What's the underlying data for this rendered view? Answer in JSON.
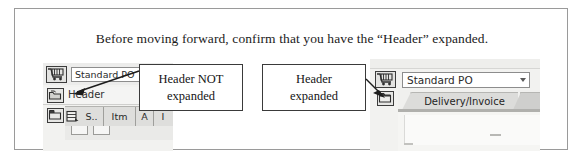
{
  "figure": {
    "caption": "Before moving forward, confirm that you have the “Header” expanded."
  },
  "callouts": [
    {
      "id": "header-not-expanded",
      "line1": "Header NOT",
      "line2": "expanded",
      "points_to": "collapsed-header-toggle"
    },
    {
      "id": "header-expanded",
      "line1": "Header",
      "line2": "expanded",
      "points_to": "expanded-header-toggle"
    }
  ],
  "left_panel": {
    "cart_icon": "shopping-cart-icon",
    "po_type_value": "Standard PO",
    "header_toggle_icon": "expand-header-icon",
    "header_label": "Header",
    "item_toggle_icon": "expand-item-icon",
    "grid_select_icon": "grid-select-all-icon",
    "grid_columns": [
      "S..",
      "Itm",
      "A",
      "I"
    ]
  },
  "right_panel": {
    "cart_icon": "shopping-cart-icon",
    "po_type_value": "Standard PO",
    "po_type_dropdown_icon": "chevron-down-icon",
    "header_toggle_icon": "collapse-header-icon",
    "tabs": [
      {
        "label": "Delivery/Invoice",
        "active": true
      },
      {
        "label": "",
        "active": false
      }
    ]
  },
  "colors": {
    "figure_border": "#9a9a9a",
    "callout_border": "#3a3a3a",
    "sap_chrome": "#f2f2f0",
    "grid_header": "#dededc",
    "tab_active": "#dcdcda",
    "text": "#141414"
  }
}
